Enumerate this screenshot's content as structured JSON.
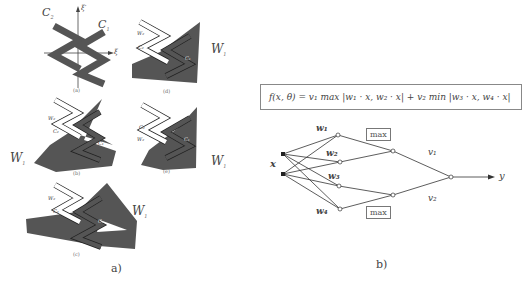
{
  "panel_a": {
    "label": "a)",
    "subfigures": [
      {
        "id": "a",
        "caption": "(a)",
        "labels": {
          "c2": "C",
          "c2_sub": "2",
          "c1": "C",
          "c1_sub": "1",
          "axis_v": "ξ′",
          "axis_h": "ξ"
        }
      },
      {
        "id": "d",
        "caption": "(d)",
        "labels": {
          "w2": "W₂",
          "c2": "C₂",
          "c1": "C₁",
          "w1": "W",
          "w1_sub": "1"
        }
      },
      {
        "id": "b",
        "caption": "(b)",
        "labels": {
          "w2": "W₂",
          "c2": "C₂",
          "c1": "C₁",
          "w1": "W",
          "w1_sub": "1"
        }
      },
      {
        "id": "e",
        "caption": "(e)",
        "labels": {
          "c2": "C₂",
          "w2": "W₂",
          "c1": "C₁",
          "w1": "W",
          "w1_sub": "1"
        }
      },
      {
        "id": "c",
        "caption": "(c)",
        "labels": {
          "w2": "W₂",
          "c2": "C₂",
          "c1": "C₁",
          "w1": "W",
          "w1_sub": "1"
        }
      }
    ]
  },
  "panel_b": {
    "label": "b)",
    "formula": "f(x, θ) = v₁ max |w₁ · x, w₂ · x| + v₂ min |w₃ · x, w₄ · x|",
    "network": {
      "input_label": "x",
      "weights": [
        "w₁",
        "w₂",
        "w₃",
        "w₄"
      ],
      "pool_top": "max",
      "pool_bottom": "max",
      "output_weights": [
        "v₁",
        "v₂"
      ],
      "output_label": "y"
    }
  },
  "colors": {
    "dark_fill": "#555555",
    "outline": "#222222",
    "white_shape": "#ffffff",
    "text": "#444444"
  }
}
